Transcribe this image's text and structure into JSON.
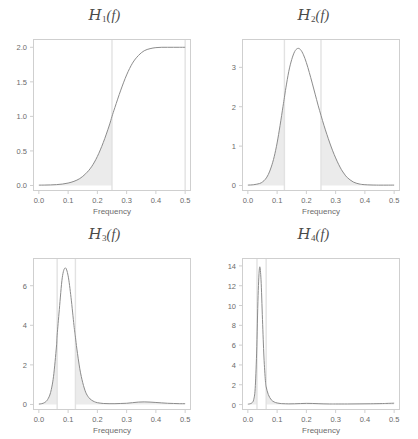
{
  "figure": {
    "width": 418,
    "height": 439,
    "background": "#ffffff",
    "layout": "2x2 grid of spectral density panels"
  },
  "style": {
    "curve_color": "#8c8c8c",
    "shade_color": "#ebebeb",
    "vline_color": "#e2e2e2",
    "frame_color": "#cfcfcf",
    "tick_text_color": "#6b6b6b",
    "title_color": "#4a4a4a"
  },
  "chart_data": [
    {
      "type": "line",
      "panel_index": 0,
      "title": "H_1(f)",
      "title_parts": {
        "symbol": "H",
        "subscript": "1",
        "argument": "(f)"
      },
      "xlabel": "Frequency",
      "ylabel": "",
      "xlim": [
        -0.02,
        0.52
      ],
      "ylim": [
        -0.08,
        2.12
      ],
      "xticks": [
        0.0,
        0.1,
        0.2,
        0.3,
        0.4,
        0.5
      ],
      "xticklabels": [
        "0.0",
        "0.1",
        "0.2",
        "0.3",
        "0.4",
        "0.5"
      ],
      "yticks": [
        0.0,
        0.5,
        1.0,
        1.5,
        2.0
      ],
      "yticklabels": [
        "0.0",
        "0.5",
        "1.0",
        "1.5",
        "2.0"
      ],
      "grid": false,
      "legend": "none",
      "vlines": [
        0.25,
        0.5
      ],
      "shaded_regions": [
        {
          "from": 0.0,
          "to": 0.25
        }
      ],
      "x": [
        0.0,
        0.02,
        0.04,
        0.06,
        0.08,
        0.1,
        0.12,
        0.14,
        0.16,
        0.18,
        0.2,
        0.22,
        0.24,
        0.25,
        0.26,
        0.28,
        0.3,
        0.32,
        0.34,
        0.36,
        0.38,
        0.4,
        0.42,
        0.44,
        0.46,
        0.48,
        0.5
      ],
      "values": [
        0.005,
        0.006,
        0.008,
        0.012,
        0.02,
        0.035,
        0.06,
        0.1,
        0.17,
        0.27,
        0.42,
        0.62,
        0.86,
        1.0,
        1.13,
        1.38,
        1.6,
        1.77,
        1.88,
        1.95,
        1.98,
        1.995,
        2.0,
        2.0,
        2.0,
        2.0,
        2.0
      ],
      "peak": {
        "x": 0.45,
        "y": 2.0
      },
      "description": "Monotonic sigmoid rising from 0 to 2.0"
    },
    {
      "type": "line",
      "panel_index": 1,
      "title": "H_2(f)",
      "title_parts": {
        "symbol": "H",
        "subscript": "2",
        "argument": "(f)"
      },
      "xlabel": "Frequency",
      "ylabel": "",
      "xlim": [
        -0.02,
        0.52
      ],
      "ylim": [
        -0.14,
        3.72
      ],
      "xticks": [
        0.0,
        0.1,
        0.2,
        0.3,
        0.4,
        0.5
      ],
      "xticklabels": [
        "0.0",
        "0.1",
        "0.2",
        "0.3",
        "0.4",
        "0.5"
      ],
      "yticks": [
        0,
        1,
        2,
        3
      ],
      "yticklabels": [
        "0",
        "1",
        "2",
        "3"
      ],
      "grid": false,
      "legend": "none",
      "vlines": [
        0.125,
        0.25
      ],
      "shaded_regions": [
        {
          "from": 0.0,
          "to": 0.125
        },
        {
          "from": 0.25,
          "to": 0.5
        }
      ],
      "x": [
        0.0,
        0.02,
        0.04,
        0.05,
        0.06,
        0.07,
        0.08,
        0.09,
        0.1,
        0.11,
        0.12,
        0.125,
        0.13,
        0.14,
        0.15,
        0.16,
        0.17,
        0.18,
        0.19,
        0.2,
        0.21,
        0.22,
        0.23,
        0.24,
        0.25,
        0.26,
        0.27,
        0.28,
        0.29,
        0.3,
        0.31,
        0.32,
        0.33,
        0.34,
        0.36,
        0.38,
        0.4,
        0.44,
        0.5
      ],
      "values": [
        0.01,
        0.02,
        0.05,
        0.09,
        0.16,
        0.28,
        0.47,
        0.73,
        1.08,
        1.52,
        2.0,
        2.24,
        2.48,
        2.9,
        3.2,
        3.4,
        3.48,
        3.45,
        3.32,
        3.12,
        2.87,
        2.6,
        2.32,
        2.04,
        1.78,
        1.53,
        1.3,
        1.08,
        0.88,
        0.7,
        0.54,
        0.4,
        0.29,
        0.2,
        0.09,
        0.04,
        0.02,
        0.01,
        0.01
      ],
      "peak": {
        "x": 0.17,
        "y": 3.48
      },
      "description": "Unimodal peak near f=0.17 with shaded tails outside 0.125-0.25"
    },
    {
      "type": "line",
      "panel_index": 2,
      "title": "H_3(f)",
      "title_parts": {
        "symbol": "H",
        "subscript": "3",
        "argument": "(f)"
      },
      "xlabel": "Frequency",
      "ylabel": "",
      "xlim": [
        -0.02,
        0.52
      ],
      "ylim": [
        -0.28,
        7.4
      ],
      "xticks": [
        0.0,
        0.1,
        0.2,
        0.3,
        0.4,
        0.5
      ],
      "xticklabels": [
        "0.0",
        "0.1",
        "0.2",
        "0.3",
        "0.4",
        "0.5"
      ],
      "yticks": [
        0,
        2,
        4,
        6
      ],
      "yticklabels": [
        "0",
        "2",
        "4",
        "6"
      ],
      "grid": false,
      "legend": "none",
      "vlines": [
        0.0625,
        0.125
      ],
      "shaded_regions": [
        {
          "from": 0.0,
          "to": 0.0625
        },
        {
          "from": 0.125,
          "to": 0.5
        }
      ],
      "x": [
        0.0,
        0.01,
        0.02,
        0.03,
        0.04,
        0.05,
        0.06,
        0.0625,
        0.07,
        0.08,
        0.09,
        0.1,
        0.11,
        0.12,
        0.125,
        0.13,
        0.14,
        0.15,
        0.16,
        0.17,
        0.18,
        0.19,
        0.2,
        0.22,
        0.24,
        0.26,
        0.28,
        0.3,
        0.32,
        0.34,
        0.36,
        0.38,
        0.4,
        0.42,
        0.44,
        0.46,
        0.48,
        0.5
      ],
      "values": [
        0.02,
        0.04,
        0.1,
        0.25,
        0.6,
        1.4,
        2.9,
        3.5,
        4.8,
        6.4,
        6.9,
        6.5,
        5.4,
        4.0,
        3.4,
        2.8,
        1.8,
        1.1,
        0.62,
        0.36,
        0.22,
        0.14,
        0.09,
        0.05,
        0.04,
        0.04,
        0.05,
        0.06,
        0.09,
        0.12,
        0.13,
        0.12,
        0.1,
        0.08,
        0.06,
        0.05,
        0.04,
        0.04
      ],
      "peak": {
        "x": 0.09,
        "y": 6.9
      },
      "secondary_bump": {
        "x": 0.36,
        "y": 0.13
      },
      "description": "Sharp peak near f=0.09 plus small bump around f=0.36"
    },
    {
      "type": "line",
      "panel_index": 3,
      "title": "H_4(f)",
      "title_parts": {
        "symbol": "H",
        "subscript": "4",
        "argument": "(f)"
      },
      "xlabel": "Frequency",
      "ylabel": "",
      "xlim": [
        -0.02,
        0.52
      ],
      "ylim": [
        -0.55,
        14.8
      ],
      "xticks": [
        0.0,
        0.1,
        0.2,
        0.3,
        0.4,
        0.5
      ],
      "xticklabels": [
        "0.0",
        "0.1",
        "0.2",
        "0.3",
        "0.4",
        "0.5"
      ],
      "yticks": [
        0,
        2,
        4,
        6,
        8,
        10,
        12,
        14
      ],
      "yticklabels": [
        "0",
        "2",
        "4",
        "6",
        "8",
        "10",
        "12",
        "14"
      ],
      "grid": false,
      "legend": "none",
      "vlines": [
        0.03125,
        0.0625
      ],
      "shaded_regions": [
        {
          "from": 0.0,
          "to": 0.03125
        },
        {
          "from": 0.0625,
          "to": 0.5
        }
      ],
      "x": [
        0.0,
        0.005,
        0.01,
        0.015,
        0.02,
        0.025,
        0.03,
        0.035,
        0.04,
        0.045,
        0.05,
        0.055,
        0.06,
        0.0625,
        0.07,
        0.08,
        0.09,
        0.1,
        0.11,
        0.12,
        0.14,
        0.16,
        0.18,
        0.2,
        0.22,
        0.24,
        0.26,
        0.28,
        0.3,
        0.34,
        0.38,
        0.42,
        0.46,
        0.48,
        0.5
      ],
      "values": [
        0.04,
        0.06,
        0.1,
        0.2,
        0.5,
        1.6,
        5.2,
        11.0,
        13.85,
        12.6,
        8.6,
        4.8,
        2.4,
        1.8,
        1.0,
        0.48,
        0.26,
        0.16,
        0.11,
        0.09,
        0.07,
        0.08,
        0.1,
        0.12,
        0.11,
        0.09,
        0.07,
        0.06,
        0.06,
        0.06,
        0.07,
        0.08,
        0.1,
        0.12,
        0.14
      ],
      "peak": {
        "x": 0.04,
        "y": 13.85
      },
      "description": "Very narrow tall peak near f=0.04"
    }
  ]
}
